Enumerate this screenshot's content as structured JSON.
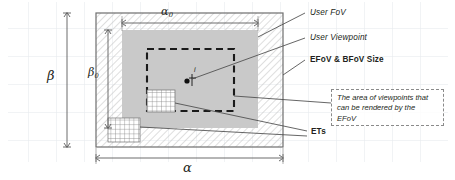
{
  "figure": {
    "kind": "viewport-field-of-view-diagram",
    "background": "#ffffff",
    "grid_color": "#e3e6ea",
    "grid_cell_px": 28
  },
  "regions": {
    "outer": {
      "name": "BFoV region",
      "fill": "hatched",
      "hatch_color": "#b9b9b9",
      "border_color": "#6e6e6e"
    },
    "inner": {
      "name": "User FoV region",
      "fill": "#c9c9c9",
      "border_color": "#c9c9c9"
    },
    "efov": {
      "name": "EFoV renderable viewpoint area",
      "stroke": "#1a1a1a",
      "dash": "dashed"
    }
  },
  "dimensions": {
    "outer_width": "α",
    "outer_height": "β",
    "inner_width_base": "α",
    "inner_width_sub": "0",
    "inner_height_base": "β",
    "inner_height_sub": "0"
  },
  "labels": {
    "user_fov": "User FoV",
    "user_viewpoint": "User Viewpoint",
    "efov_bfov_size": "EFoV & BFoV Size",
    "ets": "ETs"
  },
  "callout": {
    "line1": "The area of viewpoints that",
    "line2": "can be rendered by the",
    "line3": "EFoV"
  },
  "markers": {
    "viewpoint_label": "i"
  }
}
